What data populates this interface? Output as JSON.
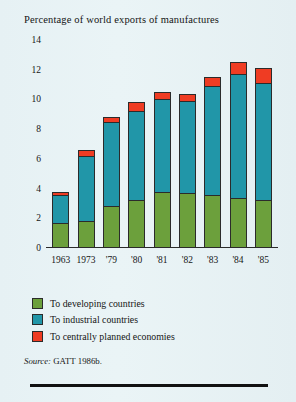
{
  "chart_data": {
    "type": "bar",
    "subtype": "stacked",
    "title": "Percentage of world exports of manufactures",
    "xlabel": "",
    "ylabel": "",
    "ylim": [
      0,
      14
    ],
    "yticks": [
      0,
      2,
      4,
      6,
      8,
      10,
      12,
      14
    ],
    "grid": false,
    "legend_position": "below-axis-left",
    "categories": [
      "1963",
      "1973",
      "'79",
      "'80",
      "'81",
      "'82",
      "'83",
      "'84",
      "'85"
    ],
    "series": [
      {
        "name": "To developing countries",
        "color": "#6ca03c",
        "values": [
          1.7,
          1.8,
          2.8,
          3.2,
          3.8,
          3.7,
          3.6,
          3.4,
          3.2
        ]
      },
      {
        "name": "To industrial countries",
        "color": "#2196a8",
        "values": [
          1.9,
          4.4,
          5.7,
          6.0,
          6.2,
          6.2,
          7.3,
          8.3,
          7.9
        ]
      },
      {
        "name": "To centrally planned economies",
        "color": "#ef3c23",
        "values": [
          0.2,
          0.4,
          0.3,
          0.6,
          0.5,
          0.5,
          0.6,
          0.8,
          1.0
        ]
      }
    ],
    "totals": [
      3.8,
      6.6,
      8.8,
      9.8,
      10.5,
      10.4,
      11.5,
      12.5,
      12.1
    ]
  },
  "legend": {
    "items": [
      {
        "label": "To developing countries",
        "color": "#6ca03c"
      },
      {
        "label": "To industrial countries",
        "color": "#2196a8"
      },
      {
        "label": "To centrally planned economies",
        "color": "#ef3c23"
      }
    ]
  },
  "source": {
    "prefix": "Source:",
    "text": "GATT 1986b."
  }
}
